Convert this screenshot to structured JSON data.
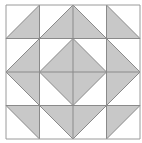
{
  "diagram": {
    "grid": {
      "origin_x": 6,
      "origin_y": 5,
      "cols": 4,
      "rows": 4,
      "cell_size": 33.5
    },
    "colors": {
      "background": "#ffffff",
      "fill": "#c8c8c8",
      "line": "#8a8a8a",
      "outer_line": "#9a9a9a"
    },
    "cells": [
      [
        {
          "diagonal": "/",
          "shaded": "bottom-right"
        },
        {
          "diagonal": "/",
          "shaded": "bottom-right"
        },
        {
          "diagonal": "\\",
          "shaded": "bottom-left"
        },
        {
          "diagonal": "\\",
          "shaded": "bottom-left"
        }
      ],
      [
        {
          "diagonal": "/",
          "shaded": "bottom-right"
        },
        {
          "diagonal": "/",
          "shaded": "bottom-right"
        },
        {
          "diagonal": "\\",
          "shaded": "bottom-left"
        },
        {
          "diagonal": "\\",
          "shaded": "bottom-left"
        }
      ],
      [
        {
          "diagonal": "\\",
          "shaded": "top-right"
        },
        {
          "diagonal": "\\",
          "shaded": "top-right"
        },
        {
          "diagonal": "/",
          "shaded": "top-left"
        },
        {
          "diagonal": "/",
          "shaded": "top-left"
        }
      ],
      [
        {
          "diagonal": "\\",
          "shaded": "top-right"
        },
        {
          "diagonal": "\\",
          "shaded": "top-right"
        },
        {
          "diagonal": "/",
          "shaded": "top-left"
        },
        {
          "diagonal": "/",
          "shaded": "top-left"
        }
      ]
    ]
  }
}
